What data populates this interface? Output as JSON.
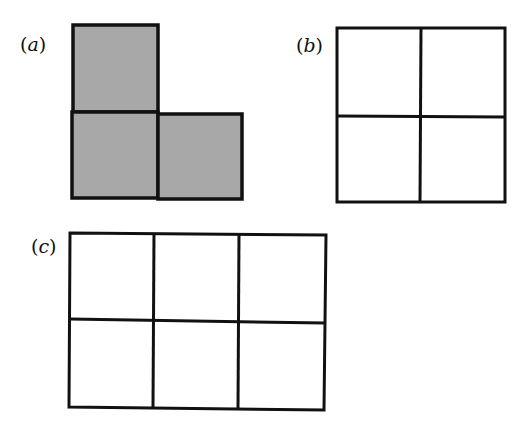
{
  "figure": {
    "panels": [
      {
        "id": "a",
        "label": "(a)",
        "description": "L-shaped tromino of three shaded unit squares",
        "fill": "#a8a8a8",
        "cells": [
          [
            0,
            0
          ],
          [
            1,
            0
          ],
          [
            1,
            1
          ]
        ]
      },
      {
        "id": "b",
        "label": "(b)",
        "description": "2 by 2 empty grid",
        "rows": 2,
        "cols": 2
      },
      {
        "id": "c",
        "label": "(c)",
        "description": "2 by 3 empty grid",
        "rows": 2,
        "cols": 3
      }
    ],
    "colors": {
      "stroke": "#111111",
      "shaded": "#a8a8a8",
      "background": "#ffffff"
    }
  }
}
